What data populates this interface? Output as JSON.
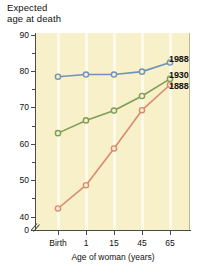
{
  "chart_data": {
    "type": "line",
    "ylabel": "Expected age at death",
    "xlabel": "Age of woman (years)",
    "categories": [
      "Birth",
      "1",
      "15",
      "45",
      "65"
    ],
    "ylim": [
      0,
      90
    ],
    "yticks": [
      0,
      40,
      50,
      60,
      70,
      80,
      90
    ],
    "ytick_labels": [
      "0",
      "40",
      "50",
      "60",
      "70",
      "80",
      "90"
    ],
    "y_minor_ticks": [
      45,
      55,
      65,
      75,
      85
    ],
    "axis_break": true,
    "grid": "vertical",
    "legend_position": "right-inline",
    "series": [
      {
        "name": "1988",
        "color": "#6f93b8",
        "marker": "circle",
        "values": [
          78.4,
          79.0,
          79.0,
          79.8,
          82.3
        ]
      },
      {
        "name": "1930",
        "color": "#7d9e5c",
        "marker": "circle",
        "values": [
          62.9,
          66.4,
          69.1,
          73.1,
          77.8
        ]
      },
      {
        "name": "1888",
        "color": "#d98a72",
        "marker": "circle",
        "values": [
          42.2,
          48.6,
          58.7,
          69.2,
          76.2
        ]
      }
    ],
    "plot_background": "#f8f0c8"
  },
  "axis": {
    "y_title_line1": "Expected",
    "y_title_line2": "age at death"
  }
}
